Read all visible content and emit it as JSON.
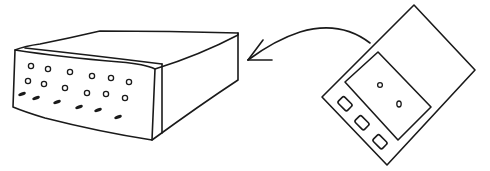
{
  "illustration": {
    "description": "Hand-drawn sketch of a handheld remote device with an arrow pointing toward a box-shaped device",
    "elements": {
      "box_device": {
        "label": "box-device",
        "front_holes_rows": 3
      },
      "arrow": {
        "label": "arrow",
        "direction": "left"
      },
      "handheld_device": {
        "label": "handheld-device",
        "buttons": 3,
        "screen_dots": 2
      }
    },
    "colors": {
      "stroke": "#1a1a1a",
      "background": "#ffffff"
    }
  }
}
